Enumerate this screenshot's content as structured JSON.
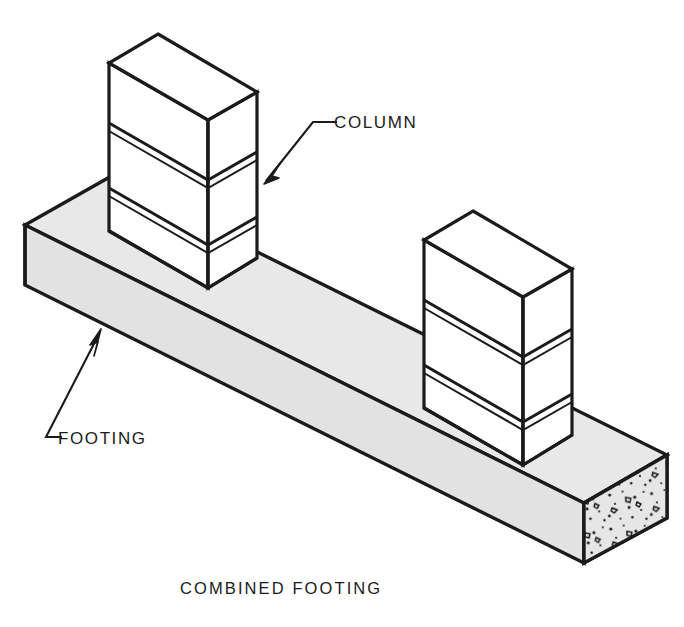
{
  "figure": {
    "caption": "COMBINED FOOTING",
    "title": "Combined Footing",
    "background_color": "#ffffff",
    "line_color": "#1b1b1b"
  },
  "labels": {
    "column": "COLUMN",
    "footing": "FOOTING"
  },
  "colors": {
    "outline": "#1b1b1b",
    "footing_top_face": "#e8e8e8",
    "footing_side_face": "#e2e2e2",
    "footing_end_face": "#e6e6e6",
    "column_face": "#ffffff",
    "aggregate": "#1b1b1b",
    "page_background": "#ffffff"
  },
  "geometry": {
    "projection": "isometric",
    "footing": {
      "name": "combined-footing-slab",
      "top_face": [
        [
          25,
          225
        ],
        [
          108,
          178
        ],
        [
          667,
          455
        ],
        [
          584,
          503
        ]
      ],
      "far_top_edge": [
        [
          108,
          178
        ],
        [
          667,
          455
        ]
      ],
      "near_side_face": [
        [
          25,
          225
        ],
        [
          584,
          503
        ],
        [
          584,
          563
        ],
        [
          25,
          285
        ]
      ],
      "end_face": [
        [
          584,
          503
        ],
        [
          667,
          455
        ],
        [
          667,
          518
        ],
        [
          584,
          563
        ]
      ],
      "depth_px": 60
    },
    "column_left": {
      "name": "left-column",
      "top_face": [
        [
          158,
          34
        ],
        [
          257,
          92
        ],
        [
          208,
          120
        ],
        [
          109,
          63
        ]
      ],
      "left_face": [
        [
          109,
          63
        ],
        [
          208,
          120
        ],
        [
          208,
          288
        ],
        [
          109,
          231
        ]
      ],
      "right_face": [
        [
          208,
          120
        ],
        [
          257,
          92
        ],
        [
          257,
          258
        ],
        [
          208,
          288
        ]
      ],
      "course_lines_y_left": [
        140,
        205
      ],
      "course_count": 3
    },
    "column_right": {
      "name": "right-column",
      "top_face": [
        [
          473,
          211
        ],
        [
          572,
          269
        ],
        [
          523,
          297
        ],
        [
          424,
          240
        ]
      ],
      "left_face": [
        [
          424,
          240
        ],
        [
          523,
          297
        ],
        [
          523,
          465
        ],
        [
          424,
          408
        ]
      ],
      "right_face": [
        [
          523,
          297
        ],
        [
          572,
          269
        ],
        [
          572,
          435
        ],
        [
          523,
          465
        ]
      ],
      "course_count": 3
    },
    "leader_column": {
      "arrow_tip": [
        266,
        180
      ],
      "elbow": [
        313,
        122
      ],
      "text_anchor": [
        325,
        122
      ]
    },
    "leader_footing": {
      "arrow_tip": [
        99,
        332
      ],
      "elbow": [
        46,
        437
      ],
      "text_anchor": [
        60,
        437
      ]
    },
    "caption_position": [
      180,
      588
    ]
  }
}
